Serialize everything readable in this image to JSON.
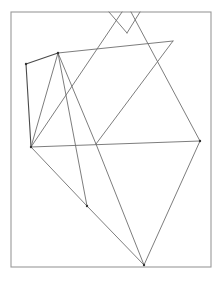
{
  "figure": {
    "type": "line-drawing",
    "colors": {
      "background": "#ffffff",
      "frame": "#9a9a9a",
      "line": "#6e6e6e",
      "vertex": "#333333"
    },
    "frame": {
      "x": 11,
      "y": 12,
      "width": 200,
      "height": 255
    },
    "points": {
      "A": [
        26,
        64
      ],
      "B": [
        58,
        53
      ],
      "C": [
        31,
        147
      ],
      "D": [
        200,
        141
      ],
      "E": [
        173,
        41
      ],
      "F": [
        87,
        206
      ],
      "G": [
        144,
        265
      ],
      "H": [
        96,
        144
      ],
      "V": [
        127,
        33
      ],
      "T1": [
        109,
        12
      ],
      "T2": [
        122,
        12
      ],
      "T3": [
        131,
        12
      ],
      "T4": [
        140,
        12
      ]
    },
    "segments": [
      [
        "A",
        "B"
      ],
      [
        "B",
        "E"
      ],
      [
        "A",
        "C"
      ],
      [
        "B",
        "C"
      ],
      [
        "B",
        "F"
      ],
      [
        "B",
        "H"
      ],
      [
        "H",
        "G"
      ],
      [
        "C",
        "F"
      ],
      [
        "F",
        "G"
      ],
      [
        "C",
        "D"
      ],
      [
        "D",
        "G"
      ],
      [
        "E",
        "H"
      ],
      [
        "C",
        "T2"
      ],
      [
        "T3",
        "D"
      ],
      [
        "T1",
        "V"
      ],
      [
        "T4",
        "V"
      ]
    ],
    "vertices_marked": [
      "A",
      "B",
      "C",
      "D",
      "F",
      "G"
    ]
  }
}
